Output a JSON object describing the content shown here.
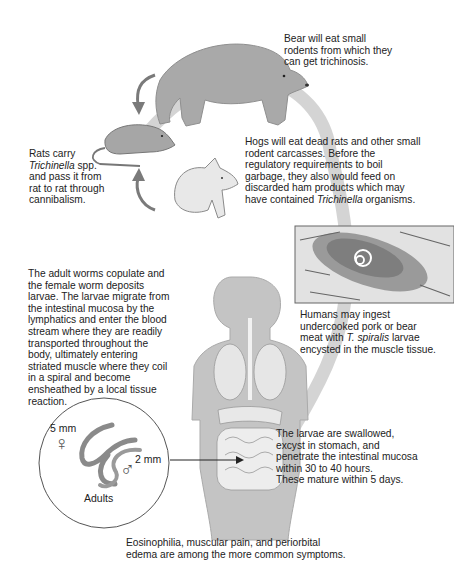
{
  "diagram": {
    "colors": {
      "cycle_arrow": "#c8c8c8",
      "arrow": "#7a7a7a",
      "animal_fill": "#a8a8a8",
      "body_fill": "#c4c4c4",
      "text": "#222222"
    },
    "captions": {
      "bear": {
        "lines": [
          "Bear will eat small",
          "rodents from which they",
          "can get trichinosis."
        ]
      },
      "rats": {
        "line1": "Rats carry",
        "line2_italic": "Trichinella",
        "line2_rest": " spp.",
        "line3": "and pass it from",
        "line4": "rat to rat through",
        "line5": "cannibalism."
      },
      "hogs": {
        "line1": "Hogs will eat dead rats and other small",
        "line2": "rodent carcasses. Before the",
        "line3": "regulatory requirements to boil",
        "line4": "garbage, they also would feed on",
        "line5": "discarded ham products which may",
        "line6_pre": "have contained ",
        "line6_italic": "Trichinella",
        "line6_post": " organisms."
      },
      "humans": {
        "line1": "Humans may ingest",
        "line2": "undercooked pork or bear",
        "line3_pre": "meat with ",
        "line3_italic": "T. spiralis",
        "line3_post": " larvae",
        "line4": "encysted in the muscle tissue."
      },
      "adults_migrate": {
        "lines": [
          "The adult worms copulate and",
          "the female worm deposits",
          "larvae. The larvae migrate from",
          "the intestinal mucosa by the",
          "lymphatics and enter the blood",
          "stream where they are readily",
          "transported throughout the",
          "body, ultimately entering",
          "striated muscle where they coil",
          "in a spiral and become",
          "ensheathed by a local tissue",
          "reaction."
        ]
      },
      "larvae_swallowed": {
        "lines": [
          "The larvae are swallowed,",
          "excyst in stomach, and",
          "penetrate the intestinal mucosa",
          "within 30 to 40 hours.",
          "These mature within 5 days."
        ]
      },
      "symptoms": {
        "lines": [
          "Eosinophilia, muscular pain, and periorbital",
          "edema are among the more common symptoms."
        ]
      }
    },
    "inset": {
      "female_size": "5 mm",
      "male_size": "2 mm",
      "label": "Adults",
      "female_symbol": "♀",
      "male_symbol": "♂"
    }
  }
}
